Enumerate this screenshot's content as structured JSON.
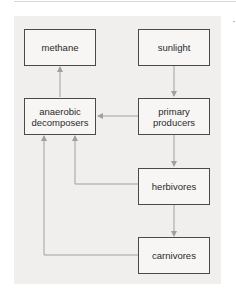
{
  "diagram": {
    "nodes": [
      {
        "id": "methane",
        "label": "methane"
      },
      {
        "id": "sunlight",
        "label": "sunlight"
      },
      {
        "id": "anaerobic_decomposers",
        "label": "anaerobic decomposers"
      },
      {
        "id": "primary_producers",
        "label": "primary producers"
      },
      {
        "id": "herbivores",
        "label": "herbivores"
      },
      {
        "id": "carnivores",
        "label": "carnivores"
      }
    ],
    "edges": [
      {
        "from": "sunlight",
        "to": "primary_producers"
      },
      {
        "from": "primary_producers",
        "to": "herbivores"
      },
      {
        "from": "herbivores",
        "to": "carnivores"
      },
      {
        "from": "primary_producers",
        "to": "anaerobic_decomposers"
      },
      {
        "from": "herbivores",
        "to": "anaerobic_decomposers"
      },
      {
        "from": "carnivores",
        "to": "anaerobic_decomposers"
      },
      {
        "from": "anaerobic_decomposers",
        "to": "methane"
      }
    ],
    "colors": {
      "panel": "#f0efed",
      "box_border": "#4a4a4a",
      "arrow": "#a0a0a0"
    }
  }
}
